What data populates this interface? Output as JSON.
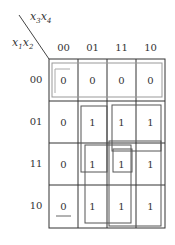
{
  "kmap": {
    "col_var": {
      "a": "x",
      "a_sub": "3",
      "b": "x",
      "b_sub": "4"
    },
    "row_var": {
      "a": "x",
      "a_sub": "1",
      "b": "x",
      "b_sub": "2"
    },
    "col_labels": [
      "00",
      "01",
      "11",
      "10"
    ],
    "row_labels": [
      "00",
      "01",
      "11",
      "10"
    ],
    "cells": [
      [
        "0",
        "0",
        "0",
        "0"
      ],
      [
        "0",
        "1",
        "1",
        "1"
      ],
      [
        "0",
        "1",
        "1",
        "1"
      ],
      [
        "0",
        "1",
        "1",
        "1"
      ]
    ],
    "groups": [
      {
        "name": "row-00-zeros",
        "style": "light"
      },
      {
        "name": "col-01-rows-01-11"
      },
      {
        "name": "cols-11-10-rows-01-11"
      },
      {
        "name": "cols-01-11-rows-11-10"
      },
      {
        "name": "cols-11-10-rows-11-10"
      },
      {
        "name": "col-11-row-11"
      }
    ]
  }
}
